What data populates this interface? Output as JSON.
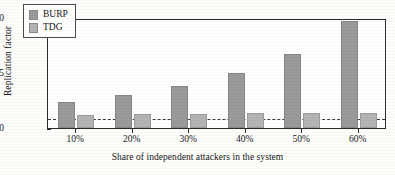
{
  "chart_data": {
    "type": "bar",
    "title": "",
    "xlabel": "Share of independent attackers in the system",
    "ylabel": "Replication factor",
    "categories": [
      "10%",
      "20%",
      "30%",
      "40%",
      "50%",
      "60%"
    ],
    "series": [
      {
        "name": "BURP",
        "color": "#9a9a9a",
        "values": [
          2.4,
          3.0,
          3.8,
          5.0,
          6.7,
          9.7
        ]
      },
      {
        "name": "TDG",
        "color": "#b4b4b4",
        "values": [
          1.2,
          1.25,
          1.25,
          1.35,
          1.35,
          1.35
        ]
      }
    ],
    "ylim": [
      0,
      10
    ],
    "yticks": [
      0,
      5,
      10
    ],
    "ytick_labels": [
      "0",
      "5",
      "10"
    ],
    "grid": false,
    "legend_position": "top-left",
    "annotations": [
      {
        "name": "reference-line",
        "type": "hline",
        "value": 1,
        "style": "dashed",
        "color": "#3a3a3a"
      }
    ]
  },
  "legend": {
    "entries": [
      {
        "label": "BURP"
      },
      {
        "label": "TDG"
      }
    ]
  },
  "axes": {
    "y_label": "Replication factor",
    "x_label": "Share of independent attackers in the system",
    "y_ticks": [
      "0",
      "5",
      "10"
    ],
    "x_ticks": [
      "10%",
      "20%",
      "30%",
      "40%",
      "50%",
      "60%"
    ]
  }
}
